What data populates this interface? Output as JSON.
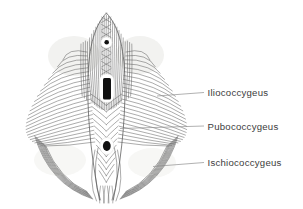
{
  "figure": {
    "background_color": "#ffffff",
    "ink_color": "#585858",
    "edge_ink_color": "#4a4a4a",
    "leader_line_color": "#8f8f8f",
    "label_text_color": "#3c3c3c"
  },
  "labels": [
    {
      "id": "iliococcygeus",
      "text": "Iliococcygeus"
    },
    {
      "id": "pubococcygeus",
      "text": "Pubococcygeus"
    },
    {
      "id": "ischiococcygeus",
      "text": "Ischiococcygeus"
    }
  ]
}
